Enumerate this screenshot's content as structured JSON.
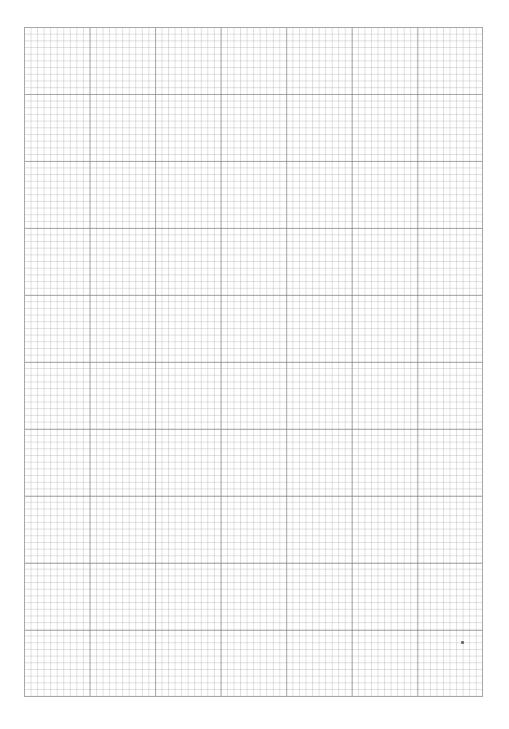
{
  "document": {
    "type": "graph-paper",
    "grid": {
      "major_columns": 7,
      "major_rows": 10,
      "minor_per_major": 10,
      "line_color_major": "#787878",
      "line_color_minor": "#c8c8c8",
      "border_color": "#a8a8a8",
      "background": "#ffffff"
    },
    "marks": [
      {
        "type": "speck",
        "x": 461,
        "y": 641
      }
    ]
  }
}
